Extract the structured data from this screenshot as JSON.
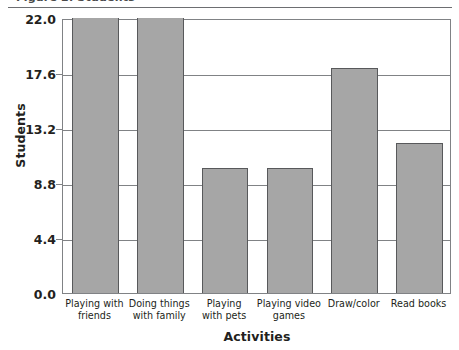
{
  "top_caption": "Figure 2. Students",
  "chart_data": {
    "type": "bar",
    "title": "",
    "xlabel": "Activities",
    "ylabel": "Students",
    "categories": [
      "Playing with friends",
      "Doing things with family",
      "Playing with pets",
      "Playing video games",
      "Draw/color",
      "Read books"
    ],
    "category_lines": [
      [
        "Playing with",
        "friends"
      ],
      [
        "Doing things",
        "with family"
      ],
      [
        "Playing",
        "with pets"
      ],
      [
        "Playing video",
        "games"
      ],
      [
        "Draw/color",
        ""
      ],
      [
        "Read books",
        ""
      ]
    ],
    "values": [
      22,
      22,
      10,
      10,
      18,
      12
    ],
    "ylim": [
      0,
      22
    ],
    "yticks": [
      "0.0",
      "4.4",
      "8.8",
      "13.2",
      "17.6",
      "22.0"
    ],
    "ytick_values": [
      0,
      4.4,
      8.8,
      13.2,
      17.6,
      22
    ],
    "grid": true,
    "legend": "none",
    "bar_color": "#a6a6a6",
    "bar_border_color": "#58595b",
    "axis_color": "#808285",
    "text_color": "#231f20"
  }
}
